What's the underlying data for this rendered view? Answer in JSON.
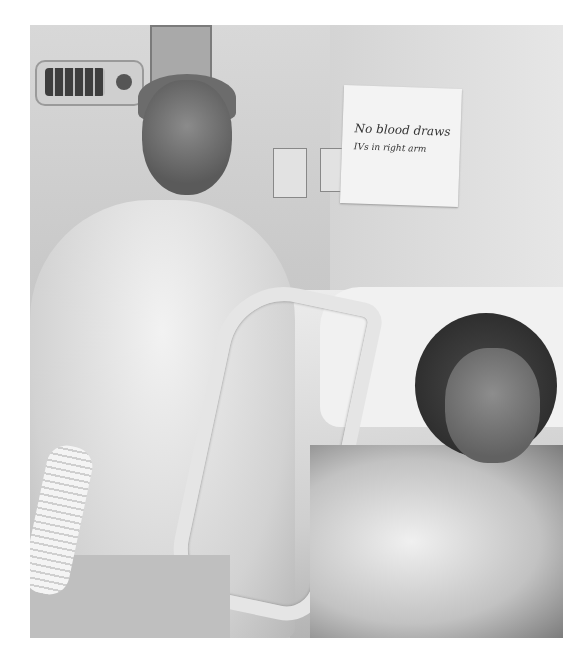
{
  "image": {
    "type": "photograph",
    "color_mode": "grayscale",
    "scene": "hospital room",
    "description": "Two women smiling at the camera in a hospital room; one stands beside the bed wearing a white hooded sweatshirt, the other lies in the hospital bed with a nasal cannula and a patterned gown."
  },
  "sign": {
    "line1": "No blood draws",
    "line2": "IVs in right arm"
  },
  "elements": {
    "standing_person": "woman in white hoodie",
    "patient": "woman in hospital bed with oxygen tubing",
    "equipment": [
      "patient monitor remote",
      "infusion pump",
      "wall outlets",
      "bed rail",
      "ventilator tubing"
    ]
  }
}
